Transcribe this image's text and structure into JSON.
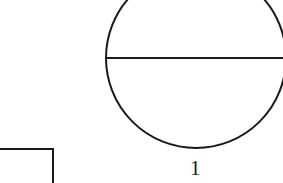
{
  "drawing": {
    "name": "technical-line-drawing",
    "width": 283,
    "height": 183,
    "background_color": "#ffffff",
    "stroke_color": "#1a1a1a",
    "stroke_width": 2
  },
  "shapes": {
    "circle": {
      "name": "circle-outline",
      "center_x": 196,
      "center_y": 58,
      "radius": 90,
      "clipped_edges": "top, right"
    },
    "diameter_line": {
      "name": "horizontal-diameter-line",
      "x1": 107,
      "y1": 58,
      "x2": 283,
      "y2": 58
    },
    "corner_bracket": {
      "name": "rectangle-corner-bottom-left",
      "horizontal_x1": 0,
      "horizontal_y": 149,
      "horizontal_x2": 53,
      "vertical_x": 53,
      "vertical_y1": 149,
      "vertical_y2": 183,
      "clipped_edges": "left, bottom"
    }
  },
  "labels": {
    "circle_label": "1"
  }
}
